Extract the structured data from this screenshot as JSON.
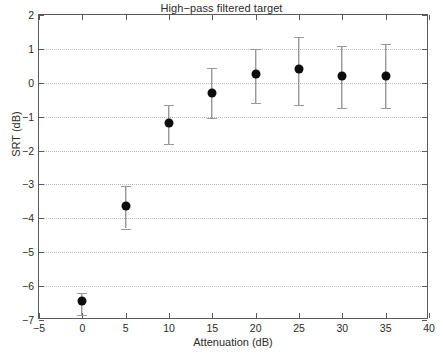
{
  "chart_data": {
    "type": "scatter",
    "title": "High−pass filtered target",
    "xlabel": "Attenuation (dB)",
    "ylabel": "SRT (dB)",
    "xlim": [
      -5,
      40
    ],
    "ylim": [
      -7,
      2
    ],
    "xticks": [
      -5,
      0,
      5,
      10,
      15,
      20,
      25,
      30,
      35,
      40
    ],
    "xtick_labels": [
      "−5",
      "0",
      "5",
      "10",
      "15",
      "20",
      "25",
      "30",
      "35",
      "40"
    ],
    "yticks": [
      -7,
      -6,
      -5,
      -4,
      -3,
      -2,
      -1,
      0,
      1,
      2
    ],
    "ytick_labels": [
      "−7",
      "−6",
      "−5",
      "−4",
      "−3",
      "−2",
      "−1",
      "0",
      "1",
      "2"
    ],
    "grid": "horizontal-dotted",
    "legend": null,
    "x": [
      0,
      5,
      10,
      15,
      20,
      25,
      30,
      35
    ],
    "values": [
      -6.45,
      -3.65,
      -1.2,
      -0.3,
      0.25,
      0.4,
      0.2,
      0.2
    ],
    "err_low": [
      -6.85,
      -4.3,
      -1.8,
      -1.05,
      -0.6,
      -0.65,
      -0.75,
      -0.75
    ],
    "err_high": [
      -6.2,
      -3.05,
      -0.65,
      0.45,
      1.0,
      1.35,
      1.1,
      1.15
    ],
    "series": [
      {
        "name": "SRT",
        "points": [
          {
            "x": 0,
            "y": -6.45,
            "low": -6.85,
            "high": -6.2
          },
          {
            "x": 5,
            "y": -3.65,
            "low": -4.3,
            "high": -3.05
          },
          {
            "x": 10,
            "y": -1.2,
            "low": -1.8,
            "high": -0.65
          },
          {
            "x": 15,
            "y": -0.3,
            "low": -1.05,
            "high": 0.45
          },
          {
            "x": 20,
            "y": 0.25,
            "low": -0.6,
            "high": 1.0
          },
          {
            "x": 25,
            "y": 0.4,
            "low": -0.65,
            "high": 1.35
          },
          {
            "x": 30,
            "y": 0.2,
            "low": -0.75,
            "high": 1.1
          },
          {
            "x": 35,
            "y": 0.2,
            "low": -0.75,
            "high": 1.15
          }
        ]
      }
    ],
    "marker_color": "#0d0d0d",
    "errorbar_color": "#6e6e6e",
    "grid_color": "#b9b9b9",
    "axis_color": "#5a5a5a"
  }
}
